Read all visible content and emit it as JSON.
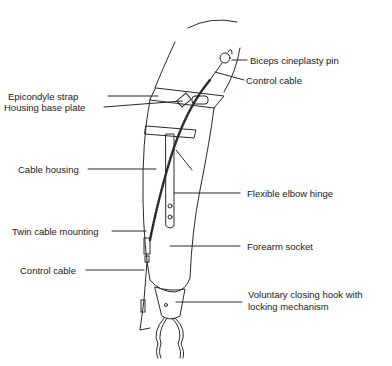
{
  "diagram": {
    "labels": {
      "biceps_pin": "Biceps cineplasty pin",
      "control_cable_top": "Control cable",
      "epicondyle_strap": "Epicondyle strap",
      "housing_base_plate": "Housing base plate",
      "cable_housing": "Cable housing",
      "flexible_elbow_hinge": "Flexible elbow hinge",
      "twin_cable_mounting": "Twin cable mounting",
      "forearm_socket": "Forearm socket",
      "control_cable_bottom": "Control cable",
      "hook_line1": "Voluntary closing hook with",
      "hook_line2": "locking mechanism"
    },
    "colors": {
      "line": "#2a2a2a",
      "text": "#1a1a1a",
      "background": "#ffffff"
    }
  }
}
